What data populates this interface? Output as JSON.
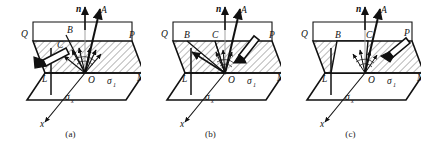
{
  "figure": {
    "type": "technical-line-diagram",
    "panel_count": 3,
    "background_color": "#ffffff",
    "line_color": "#111111",
    "hatch_color": "#333333"
  },
  "panels": [
    {
      "id": "a",
      "caption": "(a)",
      "labels": {
        "normal_axis": "n",
        "resultant": "A",
        "vertex_B": "B",
        "vertex_C": "C",
        "vertex_Q": "Q",
        "vertex_P": "P",
        "vertex_L": "L",
        "vertex_M": "M",
        "origin": "O",
        "axis_x": "x",
        "stress_1": "σ",
        "stress_1_sub": "1",
        "stress_x": "σ",
        "stress_x_sub": "x"
      }
    },
    {
      "id": "b",
      "caption": "(b)",
      "labels": {
        "normal_axis": "n",
        "resultant": "A",
        "vertex_B": "B",
        "vertex_C": "C",
        "vertex_Q": "Q",
        "vertex_P": "P",
        "vertex_L": "L",
        "vertex_M": "M",
        "origin": "O",
        "axis_x": "x",
        "stress_1": "σ",
        "stress_1_sub": "1",
        "stress_x": "σ",
        "stress_x_sub": "x"
      }
    },
    {
      "id": "c",
      "caption": "(c)",
      "labels": {
        "normal_axis": "n",
        "resultant": "A",
        "vertex_B": "B",
        "vertex_C": "C",
        "vertex_Q": "Q",
        "vertex_P": "P",
        "vertex_L": "L",
        "vertex_M": "M",
        "origin": "O",
        "axis_x": "x",
        "stress_1": "σ",
        "stress_1_sub": "1",
        "stress_x": "σ",
        "stress_x_sub": "x"
      }
    }
  ]
}
